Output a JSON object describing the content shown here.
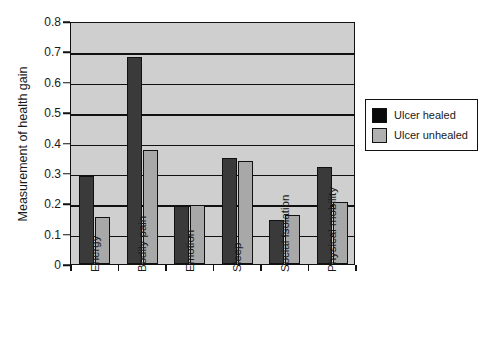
{
  "chart_data": {
    "type": "bar",
    "title": "",
    "xlabel": "",
    "ylabel": "Measurement of health gain",
    "ylim": [
      0,
      0.8
    ],
    "yticks": [
      "0",
      "0.1",
      "0.2",
      "0.3",
      "0.4",
      "0.5",
      "0.6",
      "0.7",
      "0.8"
    ],
    "ytick_values": [
      0,
      0.1,
      0.2,
      0.3,
      0.4,
      0.5,
      0.6,
      0.7,
      0.8
    ],
    "grid": true,
    "legend_position": "right",
    "categories": [
      "Energy",
      "Bodily pain",
      "Emotion",
      "Sleep",
      "Social Isolation",
      "Physical mobility"
    ],
    "series": [
      {
        "name": "Ulcer healed",
        "color": "#3a3a3a",
        "values": [
          0.29,
          0.68,
          0.19,
          0.35,
          0.145,
          0.32
        ]
      },
      {
        "name": "Ulcer unhealed",
        "color": "#a8a8a8",
        "values": [
          0.155,
          0.375,
          0.195,
          0.34,
          0.16,
          0.205
        ]
      }
    ]
  },
  "legend": {
    "items": [
      {
        "label": "Ulcer healed",
        "swatch": "healed"
      },
      {
        "label": "Ulcer unhealed",
        "swatch": "unhealed"
      }
    ]
  },
  "colors": {
    "plot_background": "#cfcfcf",
    "axis": "#111111",
    "series_healed": "#3a3a3a",
    "series_unhealed": "#a8a8a8",
    "page_background": "#ffffff"
  }
}
